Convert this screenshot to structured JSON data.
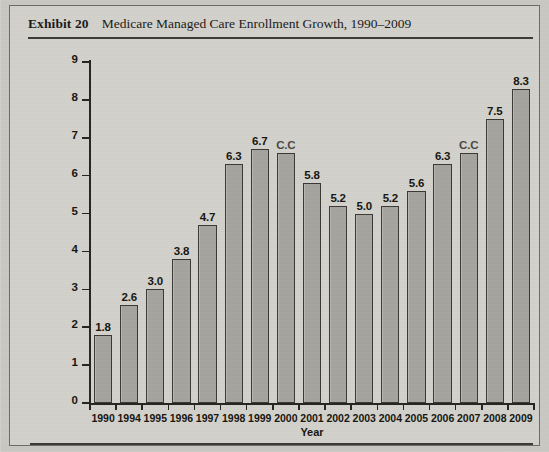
{
  "exhibit": {
    "label": "Exhibit 20",
    "title": "Medicare Managed Care Enrollment Growth, 1990–2009"
  },
  "colors": {
    "page_background": "#cfcdc8",
    "panel_background": "#d3d1cc",
    "bar_fill": "#a9a7a2",
    "bar_outline": "#3a3935",
    "axis": "#26251f",
    "text": "#16150f",
    "rule": "#3b3a37"
  },
  "chart_data": {
    "type": "bar",
    "title": "Medicare Managed Care Enrollment Growth, 1990–2009",
    "xlabel": "Year",
    "ylabel": "Medicare HMO and Cost Enrollment in Millions",
    "ylim": [
      0,
      9
    ],
    "yticks": [
      "0",
      "1",
      "2",
      "3",
      "4",
      "5",
      "6",
      "7",
      "8",
      "9"
    ],
    "grid": false,
    "legend": null,
    "categories": [
      "1990",
      "1994",
      "1995",
      "1996",
      "1997",
      "1998",
      "1999",
      "2000",
      "2001",
      "2002",
      "2003",
      "2004",
      "2005",
      "2006",
      "2007",
      "2008",
      "2009"
    ],
    "values": [
      1.8,
      2.6,
      3.0,
      3.8,
      4.7,
      6.3,
      6.7,
      6.6,
      5.8,
      5.2,
      5.0,
      5.2,
      5.6,
      6.3,
      6.6,
      7.5,
      8.3
    ],
    "data_labels": [
      "1.8",
      "2.6",
      "3.0",
      "3.8",
      "4.7",
      "6.3",
      "6.7",
      "C.C",
      "5.8",
      "5.2",
      "5.0",
      "5.2",
      "5.6",
      "6.3",
      "C.C",
      "7.5",
      "8.3"
    ]
  }
}
